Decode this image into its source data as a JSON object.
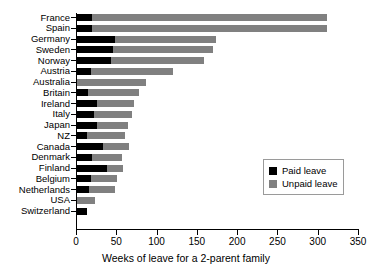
{
  "chart_data": {
    "type": "bar",
    "orientation": "horizontal",
    "stacked": true,
    "title": "",
    "xlabel": "Weeks of leave for a 2-parent family",
    "ylabel": "",
    "xlim": [
      0,
      350
    ],
    "xticks": [
      0,
      50,
      100,
      150,
      200,
      250,
      300,
      350
    ],
    "grid": false,
    "legend_position": "center-right",
    "categories": [
      "France",
      "Spain",
      "Germany",
      "Sweden",
      "Norway",
      "Austria",
      "Australia",
      "Britain",
      "Ireland",
      "Italy",
      "Japan",
      "NZ",
      "Canada",
      "Denmark",
      "Finland",
      "Belgium",
      "Netherlands",
      "USA",
      "Switzerland"
    ],
    "series": [
      {
        "name": "Paid leave",
        "color": "#000000",
        "values": [
          20,
          20,
          48,
          46,
          43,
          18,
          0,
          15,
          26,
          22,
          26,
          14,
          33,
          20,
          38,
          19,
          16,
          0,
          14
        ]
      },
      {
        "name": "Unpaid leave",
        "color": "#808080",
        "values": [
          291,
          291,
          126,
          124,
          116,
          103,
          87,
          63,
          46,
          47,
          39,
          47,
          33,
          37,
          20,
          32,
          33,
          24,
          0
        ]
      }
    ],
    "totals": [
      311,
      311,
      174,
      170,
      159,
      121,
      87,
      78,
      72,
      69,
      65,
      61,
      66,
      57,
      58,
      51,
      49,
      24,
      14
    ],
    "legend_entries": [
      "Paid leave",
      "Unpaid leave"
    ],
    "colors": {
      "paid": "#000000",
      "unpaid": "#808080",
      "axis": "#000000",
      "background": "#ffffff",
      "legend_border": "#9a9a9a"
    }
  }
}
